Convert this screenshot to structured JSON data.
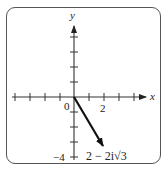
{
  "diagram": {
    "type": "complex-plane-vector",
    "axes": {
      "x_label": "x",
      "y_label": "y",
      "origin_label": "0",
      "x_tick_label": "2",
      "y_tick_label": "−4"
    },
    "vector": {
      "label": "2 − 2i√3",
      "from": [
        0,
        0
      ],
      "to": [
        2,
        -3.464
      ]
    },
    "colors": {
      "axis": "#333333",
      "vector": "#111111",
      "frame": "#555555"
    }
  }
}
